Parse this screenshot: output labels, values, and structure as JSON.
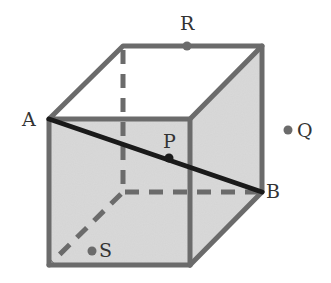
{
  "diagram": {
    "type": "cube-with-points",
    "colors": {
      "edge": "#6b6b6b",
      "face_fill": "#d4d4d4",
      "segment": "#1a1a1a",
      "point": "#6b6b6b",
      "label": "#333333"
    },
    "vertices": {
      "front_top_left": [
        49,
        119
      ],
      "front_top_right": [
        190,
        119
      ],
      "front_bottom_left": [
        49,
        265
      ],
      "front_bottom_right": [
        190,
        265
      ],
      "back_top_left": [
        123,
        46
      ],
      "back_top_right": [
        262,
        46
      ],
      "back_bottom_right": [
        262,
        192
      ],
      "back_bottom_left_hidden": [
        123,
        192
      ]
    },
    "segment_AB": {
      "from": "A",
      "to": "B"
    },
    "labels": {
      "A": "A",
      "B": "B",
      "P": "P",
      "Q": "Q",
      "R": "R",
      "S": "S"
    },
    "points": [
      {
        "name": "A",
        "x": 49,
        "y": 119,
        "label_x": 22,
        "label_y": 126
      },
      {
        "name": "B",
        "x": 262,
        "y": 192,
        "label_x": 266,
        "label_y": 198
      },
      {
        "name": "P",
        "x": 169,
        "y": 158,
        "label_x": 163,
        "label_y": 148
      },
      {
        "name": "Q",
        "x": 288,
        "y": 130,
        "label_x": 297,
        "label_y": 137
      },
      {
        "name": "R",
        "x": 187,
        "y": 46,
        "label_x": 180,
        "label_y": 30
      },
      {
        "name": "S",
        "x": 92,
        "y": 251,
        "label_x": 99,
        "label_y": 257
      }
    ]
  }
}
